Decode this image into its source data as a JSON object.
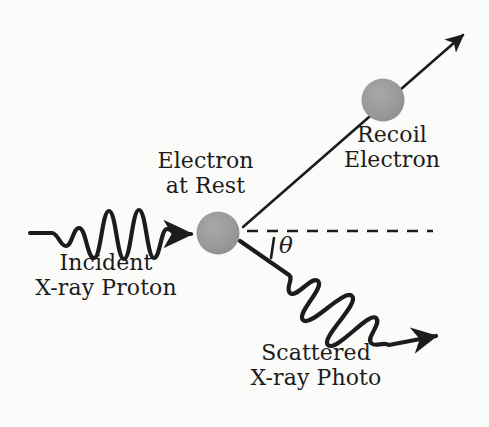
{
  "figure": {
    "background_color": "#fbfbfa",
    "ink_color": "#1c1c1c",
    "particle_color": "#9a9a9a",
    "width": 489,
    "height": 427
  },
  "labels": {
    "electron_at_rest": {
      "line1": "Electron",
      "line2": "at Rest"
    },
    "recoil_electron": {
      "line1": "Recoil",
      "line2": "Electron"
    },
    "incident_photon": {
      "line1": "Incident",
      "line2": "X-ray Proton"
    },
    "scattered_photon": {
      "line1": "Scattered",
      "line2": "X-ray Photo"
    },
    "scattering_angle": "θ"
  },
  "elements": {
    "target_electron_icon": "filled-circle",
    "recoil_electron_icon": "filled-circle",
    "incident_ray_icon": "wavy-arrow-right",
    "scattered_ray_icon": "wavy-arrow-down-right",
    "recoil_ray_icon": "straight-arrow-up-right",
    "reference_axis_icon": "dashed-horizontal-line",
    "angle_marker_icon": "angle-tick"
  }
}
